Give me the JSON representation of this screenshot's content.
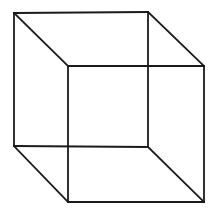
{
  "figure": {
    "background": "#ffffff",
    "stroke_color": "#1a1a1a",
    "stroke_width": 1.8,
    "vertices": {
      "back_top_left": [
        14,
        13
      ],
      "back_top_right": [
        148,
        12
      ],
      "back_bottom_left": [
        14,
        146
      ],
      "back_bottom_right": [
        148,
        147
      ],
      "front_top_left": [
        68,
        66
      ],
      "front_top_right": [
        204,
        66
      ],
      "front_bottom_left": [
        68,
        202
      ],
      "front_bottom_right": [
        204,
        202
      ]
    },
    "edges": [
      [
        "back_top_left",
        "back_top_right"
      ],
      [
        "back_top_right",
        "back_bottom_right"
      ],
      [
        "back_bottom_right",
        "back_bottom_left"
      ],
      [
        "back_bottom_left",
        "back_top_left"
      ],
      [
        "front_top_left",
        "front_top_right"
      ],
      [
        "front_top_right",
        "front_bottom_right"
      ],
      [
        "front_bottom_right",
        "front_bottom_left"
      ],
      [
        "front_bottom_left",
        "front_top_left"
      ],
      [
        "back_top_left",
        "front_top_left"
      ],
      [
        "back_top_right",
        "front_top_right"
      ],
      [
        "back_bottom_left",
        "front_bottom_left"
      ],
      [
        "back_bottom_right",
        "front_bottom_right"
      ]
    ]
  }
}
